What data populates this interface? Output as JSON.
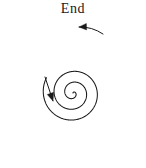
{
  "figure": {
    "type": "spiral-diagram",
    "background_color": "#ffffff",
    "stroke_color": "#1a1a1a",
    "width": 146,
    "height": 168
  },
  "labels": {
    "end": "End"
  },
  "chart_data": {
    "type": "line",
    "title": "End",
    "subtitle": "",
    "xlabel": "",
    "ylabel": "",
    "grid": false,
    "legend_position": "none",
    "curve": {
      "name": "archimedean-spiral",
      "center_x": 73,
      "center_y": 93,
      "a": 0.0,
      "b": 10.8,
      "theta_start_deg": 0,
      "theta_end_deg": 1020,
      "turns": 2.83,
      "max_radius_px": 68,
      "direction": "counterclockwise-outward"
    },
    "annotations": [
      {
        "name": "end-label",
        "text": "End",
        "x": 73,
        "y": 10
      },
      {
        "name": "outer-direction-arrow",
        "text": "",
        "tip_x": 79,
        "tip_y": 27,
        "tail_x": 103,
        "tail_y": 34,
        "points": "down-left"
      },
      {
        "name": "inner-direction-arrow",
        "text": "",
        "tip_x": 53,
        "tip_y": 101,
        "tail_x": 45,
        "tail_y": 77,
        "points": "down-right"
      }
    ]
  }
}
